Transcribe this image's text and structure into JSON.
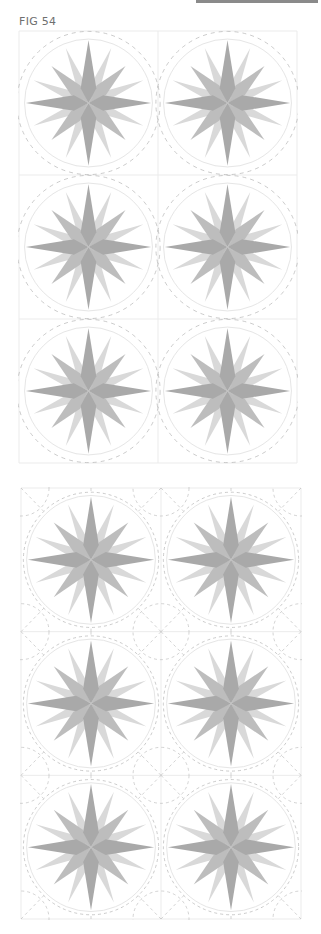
{
  "figure": {
    "label": "FIG 54"
  },
  "colors": {
    "main_points": "#a9a9a9",
    "diagonal_points": "#bdbdbd",
    "secondary_points": "#d9d9d9",
    "circle": "#e6e6e6",
    "grid": "#ebebeb",
    "dashes": "#b5b5b5",
    "topbar": "#8a8a8a"
  },
  "panels": [
    {
      "name": "quilting-layout-a",
      "description": "2x3 grid of compass star blocks with dashed arcs between block corners",
      "rows": 3,
      "cols": 2
    },
    {
      "name": "quilting-layout-b",
      "description": "2x3 grid of compass star blocks with concentric dashed circles and radiating dashed lines",
      "rows": 3,
      "cols": 2
    }
  ]
}
